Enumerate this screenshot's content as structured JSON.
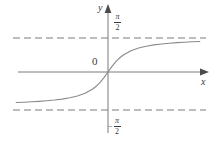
{
  "figure": {
    "background_color": "#ffffff",
    "stroke_color": "#7a7a7a",
    "text_color": "#3a3a3a",
    "axes": {
      "x_label": "x",
      "y_label": "y",
      "origin_label": "0"
    },
    "asymptote_labels": {
      "positive": {
        "minus": "",
        "numerator": "π",
        "denominator": "2"
      },
      "negative": {
        "minus": "−",
        "numerator": "π",
        "denominator": "2"
      }
    }
  },
  "chart_data": {
    "type": "line",
    "title": "",
    "subtitle": "",
    "xlabel": "x",
    "ylabel": "y",
    "function": "y = arctan(x)",
    "grid": false,
    "legend": null,
    "xlim": [
      -6.2,
      6.2
    ],
    "ylim": [
      -2.0,
      2.0
    ],
    "x_axis_pixel_y": 72,
    "y_axis_pixel_x": 108,
    "x_pixels_per_unit": 15.3,
    "y_pixels_per_unit": 21.7,
    "asymptotes": [
      {
        "type": "horizontal",
        "value": 1.5708,
        "label": "π/2",
        "style": "dashed",
        "pixel_y": 38
      },
      {
        "type": "horizontal",
        "value": -1.5708,
        "label": "-π/2",
        "style": "dashed",
        "pixel_y": 110
      }
    ],
    "x": [
      -6.0,
      -5.5,
      -5.0,
      -4.5,
      -4.0,
      -3.5,
      -3.0,
      -2.5,
      -2.0,
      -1.5,
      -1.0,
      -0.75,
      -0.5,
      -0.25,
      0.0,
      0.25,
      0.5,
      0.75,
      1.0,
      1.5,
      2.0,
      2.5,
      3.0,
      3.5,
      4.0,
      4.5,
      5.0,
      5.5,
      6.0
    ],
    "values": [
      -1.406,
      -1.391,
      -1.373,
      -1.352,
      -1.326,
      -1.292,
      -1.249,
      -1.19,
      -1.107,
      -0.983,
      -0.785,
      -0.644,
      -0.464,
      -0.245,
      0.0,
      0.245,
      0.464,
      0.644,
      0.785,
      0.983,
      1.107,
      1.19,
      1.249,
      1.292,
      1.326,
      1.352,
      1.373,
      1.391,
      1.406
    ],
    "ticks": {
      "y": [
        {
          "value": 1.5708,
          "label": "π/2"
        },
        {
          "value": 0,
          "label": "0"
        },
        {
          "value": -1.5708,
          "label": "-π/2"
        }
      ],
      "x": []
    }
  }
}
